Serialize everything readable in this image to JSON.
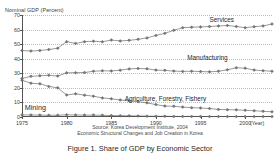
{
  "chart_data": {
    "type": "line",
    "title": "",
    "xlabel": "(Year)",
    "ylabel": "Nominal GDP (Percent)",
    "ylim": [
      0,
      70
    ],
    "xlim": [
      1975,
      2003
    ],
    "grid": true,
    "legend_position": "inline-annotations",
    "yticks": [
      0,
      10,
      20,
      30,
      40,
      50,
      60,
      70
    ],
    "xticks": [
      1975,
      1980,
      1985,
      1990,
      1995,
      2000
    ],
    "x": [
      1975,
      1976,
      1977,
      1978,
      1979,
      1980,
      1981,
      1982,
      1983,
      1984,
      1985,
      1986,
      1987,
      1988,
      1989,
      1990,
      1991,
      1992,
      1993,
      1994,
      1995,
      1996,
      1997,
      1998,
      1999,
      2000,
      2001,
      2002,
      2003
    ],
    "series": [
      {
        "name": "Services",
        "values": [
          45.6,
          45.3,
          45.6,
          46.3,
          47.2,
          51.7,
          50.5,
          51.7,
          52.0,
          51.6,
          52.8,
          52.2,
          52.6,
          53.3,
          54.3,
          56.0,
          57.4,
          59.5,
          61.3,
          61.6,
          61.8,
          62.1,
          62.5,
          62.8,
          62.1,
          61.3,
          62.0,
          62.5,
          63.8
        ]
      },
      {
        "name": "Manufacturing",
        "values": [
          26.4,
          27.9,
          28.3,
          28.6,
          28.1,
          30.3,
          30.4,
          30.5,
          31.4,
          31.7,
          31.6,
          32.1,
          33.0,
          33.3,
          33.1,
          32.2,
          32.0,
          31.5,
          31.3,
          31.4,
          31.2,
          31.0,
          31.4,
          32.4,
          33.8,
          33.5,
          32.2,
          31.8,
          31.4
        ]
      },
      {
        "name": "Agriculture, Forestry, Fishery",
        "values": [
          25.2,
          23.2,
          22.8,
          21.0,
          20.0,
          15.1,
          15.9,
          15.0,
          14.3,
          13.1,
          12.5,
          11.7,
          11.0,
          10.5,
          9.7,
          8.5,
          7.5,
          7.4,
          6.8,
          6.4,
          6.2,
          5.8,
          5.2,
          5.0,
          4.9,
          4.6,
          4.3,
          3.9,
          3.6
        ]
      },
      {
        "name": "Mining",
        "values": [
          1.4,
          1.4,
          1.3,
          1.2,
          1.2,
          1.5,
          1.4,
          1.3,
          1.3,
          1.2,
          1.0,
          0.9,
          0.8,
          0.7,
          0.6,
          0.5,
          0.5,
          0.4,
          0.4,
          0.4,
          0.4,
          0.3,
          0.3,
          0.3,
          0.3,
          0.3,
          0.3,
          0.3,
          0.3
        ]
      }
    ]
  },
  "axis": {
    "y_label": "Nominal GDP (Percent)",
    "x_unit_label": "(Year)",
    "y_tick_labels": [
      "0",
      "10",
      "20",
      "30",
      "40",
      "50",
      "60",
      "70"
    ],
    "x_tick_labels": [
      "1975",
      "1980",
      "1985",
      "1990",
      "1995",
      "2000"
    ]
  },
  "annotations": {
    "services": "Services",
    "manufacturing": "Manufacturing",
    "agriculture": "Agriculture, Forestry, Fishery",
    "mining": "Mining"
  },
  "source": {
    "line1": "Source: Korea Development Institute, 2004",
    "line2": "Economic Structural Changes and Job Creation in Korea"
  },
  "caption": "Figure 1. Share of GDP by Economic Sector",
  "colors": {
    "line": "#555555",
    "marker": "#777777",
    "grid": "#bdbdbd",
    "axis": "#555555",
    "text": "#1f1f1f"
  }
}
